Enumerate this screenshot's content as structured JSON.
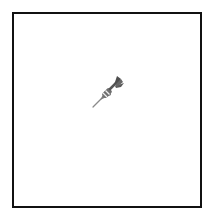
{
  "canvas": {
    "background": "#ffffff",
    "border_color": "#111111"
  },
  "icon": {
    "name": "dart-icon",
    "colors": {
      "flight": "#555555",
      "barrel": "#777777",
      "band": "#e8e8e8",
      "tip": "#888888"
    }
  }
}
